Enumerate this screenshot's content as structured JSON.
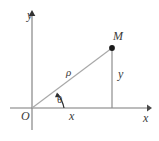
{
  "figure": {
    "background_color": "#ffffff",
    "axis_color": "#7a7a7a",
    "ray_color": "#a8a8a8",
    "point_color": "#1a1a1a",
    "label_color": "#3a3a3a",
    "labels": {
      "axis_y": "y",
      "axis_x": "x",
      "origin": "O",
      "point_m": "M",
      "radius_rho": "ρ",
      "angle_theta": "θ",
      "projection_x": "x",
      "projection_y": "y"
    },
    "icons": {
      "y_axis_arrow": "arrow-up-icon",
      "x_axis_arrow": "arrow-right-icon",
      "angle_arc_arrow": "arc-arrow-icon",
      "point_marker": "filled-dot-icon"
    },
    "geometry": {
      "origin": {
        "x": 32,
        "y": 108
      },
      "point_m": {
        "x": 112,
        "y": 48
      },
      "x_axis_start": {
        "x": 10,
        "y": 108
      },
      "x_axis_end": {
        "x": 150,
        "y": 108
      },
      "y_axis_top": {
        "x": 32,
        "y": 12
      },
      "y_axis_bottom": {
        "x": 32,
        "y": 130
      },
      "angle_theta_degrees": 37
    }
  }
}
